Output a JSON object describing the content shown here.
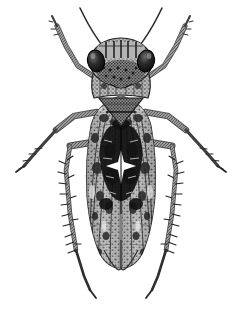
{
  "image": {
    "domain": "Natural-Image",
    "kind": "scientific-illustration",
    "subject": "insect-dorsal-view",
    "technique": "stipple-and-hatch halftone engraving",
    "palette": "grayscale",
    "caption": "",
    "title": "",
    "width": 240,
    "height": 319,
    "background_color": "#ffffff",
    "ink_color": "#1a1a1a",
    "midtone_color": "#8d8d8d",
    "shadow_color": "#3a3a3a",
    "highlight_color": "#f2f2f2"
  },
  "specimen": {
    "orientation": "dorsal",
    "symmetry": "bilateral, vertical midline at x=121",
    "body_top": 40,
    "body_bottom": 272,
    "body_left": 86,
    "body_right": 158,
    "parts": [
      {
        "name": "antenna-left",
        "label": "left antenna",
        "description": "long fine bristle sweeping up and left from above the eye",
        "color": "#2b2b2b"
      },
      {
        "name": "antenna-right",
        "label": "right antenna",
        "description": "long fine bristle sweeping up and right from above the eye",
        "color": "#2b2b2b"
      },
      {
        "name": "compound-eye-left",
        "label": "left compound eye",
        "description": "dark glossy oval set at the outer corner of the head",
        "color": "#1b1b1b"
      },
      {
        "name": "compound-eye-right",
        "label": "right compound eye",
        "description": "dark glossy oval set at the outer corner of the head",
        "color": "#1b1b1b"
      },
      {
        "name": "vertex",
        "label": "vertex / crown",
        "description": "pale banded crown between the eyes with vertical dark striping",
        "color": "#9a9a9a"
      },
      {
        "name": "frons",
        "label": "frons",
        "description": "heavily stippled face below the crown, coarse dark speckling",
        "color": "#6e6e6e"
      },
      {
        "name": "pronotum",
        "label": "pronotum",
        "description": "broad transverse plate behind the head, finely mottled",
        "color": "#8a8a8a"
      },
      {
        "name": "scutellum",
        "label": "scutellum",
        "description": "triangular plate with transverse groove at mid-body",
        "color": "#7d7d7d"
      },
      {
        "name": "forewing-left",
        "label": "left forewing (tegmen)",
        "description": "elongate wing with longitudinal venation and dense dark mottling",
        "color": "#8f8f8f"
      },
      {
        "name": "forewing-right",
        "label": "right forewing (tegmen)",
        "description": "elongate wing with longitudinal venation and dense dark mottling",
        "color": "#8f8f8f"
      },
      {
        "name": "wing-dark-blotch",
        "label": "central dark blotch",
        "description": "large irregular black patch across both wings near mid-length",
        "color": "#141414"
      },
      {
        "name": "pale-star-mark",
        "label": "pale star mark",
        "description": "small white star-shaped highlight inside the dark blotch",
        "color": "#ffffff"
      },
      {
        "name": "wing-apex",
        "label": "wing apex",
        "description": "rounded overlapping wing tips at the posterior end",
        "color": "#7a7a7a"
      },
      {
        "name": "foreleg-left",
        "label": "left foreleg",
        "description": "slender leg angled up and out to the upper left",
        "color": "#5f5f5f"
      },
      {
        "name": "foreleg-right",
        "label": "right foreleg",
        "description": "slender leg angled up and out to the upper right",
        "color": "#5f5f5f"
      },
      {
        "name": "midleg-left",
        "label": "left midleg",
        "description": "leg projecting laterally left with fine tarsal spines",
        "color": "#5f5f5f"
      },
      {
        "name": "midleg-right",
        "label": "right midleg",
        "description": "leg projecting laterally right with fine tarsal spines",
        "color": "#5f5f5f"
      },
      {
        "name": "hindleg-left",
        "label": "left hindleg",
        "description": "long spined tibia running down the left side to a tarsus",
        "color": "#4a4a4a"
      },
      {
        "name": "hindleg-right",
        "label": "right hindleg",
        "description": "long spined tibia running down the right side to a tarsus",
        "color": "#4a4a4a"
      }
    ]
  }
}
